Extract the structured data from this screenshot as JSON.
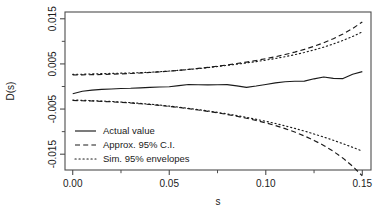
{
  "chart_data": {
    "type": "line",
    "title": "",
    "xlabel": "s",
    "ylabel": "D(s)",
    "xlim": [
      -0.004,
      0.1545
    ],
    "ylim": [
      -0.0185,
      0.0165
    ],
    "xticks": [
      0.0,
      0.05,
      0.1,
      0.15
    ],
    "xticklabels": [
      "0.00",
      "0.05",
      "0.10",
      "0.15"
    ],
    "xminorticks": [
      0.025,
      0.075,
      0.125
    ],
    "yticks": [
      -0.015,
      -0.005,
      0.005,
      0.015
    ],
    "yticklabels": [
      "-0.015",
      "-0.005",
      "0.005",
      "0.015"
    ],
    "yminorticks": [
      -0.01,
      0.0,
      0.01
    ],
    "grid": false,
    "legend_position": "lower left",
    "legend": [
      {
        "label": "Actual value",
        "style": "solid"
      },
      {
        "label": "Approx. 95% C.I.",
        "style": "dashed"
      },
      {
        "label": "Sim. 95% envelopes",
        "style": "dotted"
      }
    ],
    "series": [
      {
        "name": "Actual value",
        "style": "solid",
        "x": [
          0.0,
          0.005,
          0.01,
          0.015,
          0.02,
          0.025,
          0.03,
          0.035,
          0.04,
          0.045,
          0.05,
          0.055,
          0.06,
          0.065,
          0.07,
          0.075,
          0.08,
          0.085,
          0.09,
          0.095,
          0.1,
          0.105,
          0.11,
          0.115,
          0.12,
          0.125,
          0.13,
          0.135,
          0.14,
          0.145,
          0.15
        ],
        "y": [
          -0.0016,
          -0.00105,
          -0.0008,
          -0.00065,
          -0.00055,
          -0.00045,
          -0.0004,
          -0.0003,
          -0.0002,
          -0.00012,
          -5e-05,
          0.0002,
          0.00045,
          0.00038,
          0.00035,
          0.00038,
          0.0004,
          0.00015,
          -0.0002,
          0.0001,
          0.00045,
          0.0008,
          0.00105,
          0.00115,
          0.0012,
          0.0017,
          0.0021,
          0.0018,
          0.00175,
          0.0027,
          0.0033
        ]
      },
      {
        "name": "Approx. 95% C.I. upper",
        "style": "dashed",
        "x": [
          0.0,
          0.005,
          0.01,
          0.015,
          0.02,
          0.025,
          0.03,
          0.035,
          0.04,
          0.045,
          0.05,
          0.055,
          0.06,
          0.065,
          0.07,
          0.075,
          0.08,
          0.085,
          0.09,
          0.095,
          0.1,
          0.105,
          0.11,
          0.115,
          0.12,
          0.125,
          0.13,
          0.135,
          0.14,
          0.145,
          0.15
        ],
        "y": [
          0.00255,
          0.00258,
          0.00262,
          0.00266,
          0.00272,
          0.0028,
          0.00288,
          0.00298,
          0.0031,
          0.00324,
          0.0034,
          0.00358,
          0.00378,
          0.004,
          0.00424,
          0.0045,
          0.00478,
          0.00508,
          0.0054,
          0.00576,
          0.00616,
          0.0066,
          0.00708,
          0.00762,
          0.00822,
          0.0089,
          0.00968,
          0.01058,
          0.01162,
          0.01285,
          0.0143
        ]
      },
      {
        "name": "Approx. 95% C.I. lower",
        "style": "dashed",
        "x": [
          0.0,
          0.005,
          0.01,
          0.015,
          0.02,
          0.025,
          0.03,
          0.035,
          0.04,
          0.045,
          0.05,
          0.055,
          0.06,
          0.065,
          0.07,
          0.075,
          0.08,
          0.085,
          0.09,
          0.095,
          0.1,
          0.105,
          0.11,
          0.115,
          0.12,
          0.125,
          0.13,
          0.135,
          0.14,
          0.145,
          0.15
        ],
        "y": [
          -0.0031,
          -0.00315,
          -0.00322,
          -0.0033,
          -0.0034,
          -0.00352,
          -0.00366,
          -0.00382,
          -0.004,
          -0.0042,
          -0.00442,
          -0.00466,
          -0.00492,
          -0.0052,
          -0.0055,
          -0.00584,
          -0.0062,
          -0.0066,
          -0.00704,
          -0.00752,
          -0.00806,
          -0.00866,
          -0.00934,
          -0.0101,
          -0.01096,
          -0.01194,
          -0.01306,
          -0.01436,
          -0.01588,
          -0.01768,
          -0.0198
        ]
      },
      {
        "name": "Sim. 95% envelope upper",
        "style": "dotted",
        "x": [
          0.0,
          0.005,
          0.01,
          0.015,
          0.02,
          0.025,
          0.03,
          0.035,
          0.04,
          0.045,
          0.05,
          0.055,
          0.06,
          0.065,
          0.07,
          0.075,
          0.08,
          0.085,
          0.09,
          0.095,
          0.1,
          0.105,
          0.11,
          0.115,
          0.12,
          0.125,
          0.13,
          0.135,
          0.14,
          0.145,
          0.15
        ],
        "y": [
          0.00268,
          0.00272,
          0.00278,
          0.00284,
          0.0029,
          0.00296,
          0.003,
          0.00306,
          0.00316,
          0.00328,
          0.00342,
          0.00358,
          0.00376,
          0.00396,
          0.00418,
          0.00442,
          0.00468,
          0.00494,
          0.00522,
          0.00552,
          0.00584,
          0.0062,
          0.0066,
          0.00704,
          0.00754,
          0.0081,
          0.00872,
          0.00942,
          0.0102,
          0.01108,
          0.01208
        ]
      },
      {
        "name": "Sim. 95% envelope lower",
        "style": "dotted",
        "x": [
          0.0,
          0.005,
          0.01,
          0.015,
          0.02,
          0.025,
          0.03,
          0.035,
          0.04,
          0.045,
          0.05,
          0.055,
          0.06,
          0.065,
          0.07,
          0.075,
          0.08,
          0.085,
          0.09,
          0.095,
          0.1,
          0.105,
          0.11,
          0.115,
          0.12,
          0.125,
          0.13,
          0.135,
          0.14,
          0.145,
          0.15
        ],
        "y": [
          -0.003,
          -0.00306,
          -0.00314,
          -0.00322,
          -0.00332,
          -0.00344,
          -0.00358,
          -0.00374,
          -0.00392,
          -0.00412,
          -0.00434,
          -0.00458,
          -0.00484,
          -0.00512,
          -0.00542,
          -0.00574,
          -0.00608,
          -0.00644,
          -0.00684,
          -0.00726,
          -0.00772,
          -0.0082,
          -0.00872,
          -0.00928,
          -0.00988,
          -0.01052,
          -0.0112,
          -0.01192,
          -0.01268,
          -0.01348,
          -0.01432
        ]
      }
    ],
    "colors": {
      "line": "#1a1a1a",
      "axis": "#4d4d4d",
      "background": "#ffffff"
    }
  }
}
